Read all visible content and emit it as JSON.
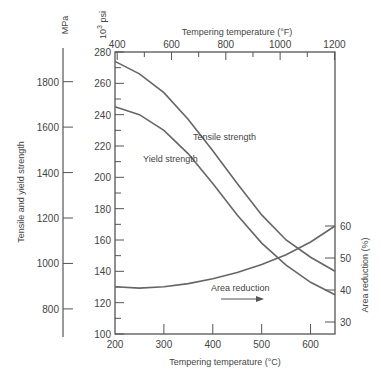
{
  "chart_data": {
    "type": "line",
    "title": "",
    "xlabel": "Tempering temperature (°C)",
    "x2label": "Tempering temperature (°F)",
    "ylabel": "Tensile and yield strength",
    "ylabel_units_left": "MPa",
    "ylabel_units_inner": "10^3 psi",
    "y2label": "Area reduction (%)",
    "xlim": [
      200,
      650
    ],
    "ylim": [
      100,
      280
    ],
    "x_ticks": [
      200,
      300,
      400,
      500,
      600
    ],
    "x2_ticks": [
      400,
      600,
      800,
      1000,
      1200
    ],
    "y_ticks_ksi": [
      100,
      120,
      140,
      160,
      180,
      200,
      220,
      240,
      260,
      280
    ],
    "y_ticks_mpa": [
      800,
      1000,
      1200,
      1400,
      1600,
      1800
    ],
    "y2_ticks": [
      30,
      40,
      50,
      60
    ],
    "grid": false,
    "series": [
      {
        "name": "Tensile strength",
        "unit": "ksi",
        "x": [
          200,
          250,
          300,
          350,
          400,
          450,
          500,
          550,
          600,
          650
        ],
        "values": [
          274,
          266,
          254,
          237,
          217,
          196,
          176,
          160,
          149,
          140
        ]
      },
      {
        "name": "Yield strength",
        "unit": "ksi",
        "x": [
          200,
          250,
          300,
          350,
          400,
          450,
          500,
          550,
          600,
          650
        ],
        "values": [
          245,
          240,
          230,
          215,
          196,
          176,
          158,
          144,
          133,
          125
        ]
      },
      {
        "name": "Area reduction",
        "unit": "%",
        "axis": "right",
        "x": [
          200,
          250,
          300,
          350,
          400,
          450,
          500,
          550,
          600,
          650
        ],
        "values": [
          41,
          40.6,
          41,
          42,
          43.5,
          45.5,
          48,
          51,
          55,
          60
        ]
      }
    ],
    "annotations": [
      "Tensile strength",
      "Yield strength",
      "Area reduction →"
    ]
  },
  "labels": {
    "mpa": "MPa",
    "psi": "10",
    "psi_exp": "3",
    "psi_unit": " psi",
    "top_title": "Tempering temperature (°F)",
    "bottom_title": "Tempering temperature (°C)",
    "left_title": "Tensile and yield strength",
    "right_title": "Area reduction (%)",
    "tensile": "Tensile strength",
    "yield": "Yield strength",
    "area": "Area reduction"
  }
}
